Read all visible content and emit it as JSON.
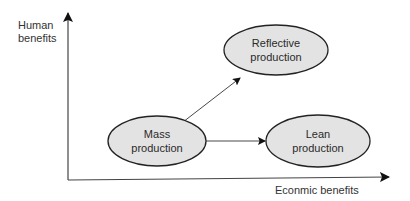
{
  "axes": {
    "y_label_line1": "Human",
    "y_label_line2": "benefits",
    "x_label": "Econmic benefits"
  },
  "nodes": [
    {
      "id": "mass",
      "line1": "Mass",
      "line2": "production"
    },
    {
      "id": "reflective",
      "line1": "Reflective",
      "line2": "production"
    },
    {
      "id": "lean",
      "line1": "Lean",
      "line2": "production"
    }
  ],
  "edges": [
    {
      "from": "mass",
      "to": "reflective"
    },
    {
      "from": "mass",
      "to": "lean"
    }
  ],
  "colors": {
    "node_fill": "#e3e3e3",
    "node_stroke": "#222222",
    "axis": "#333333",
    "text": "#333333"
  }
}
